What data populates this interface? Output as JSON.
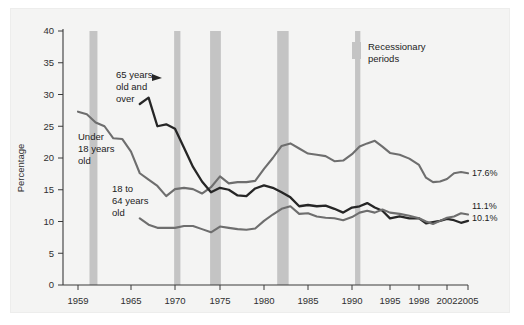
{
  "chart_data": {
    "type": "line",
    "title": "",
    "xlabel": "",
    "ylabel": "Percentage",
    "xlim": [
      1959,
      2005
    ],
    "ylim": [
      0,
      40
    ],
    "grid": false,
    "legend_position": "top-right",
    "y_ticks": [
      "0",
      "5",
      "10",
      "15",
      "20",
      "25",
      "30",
      "35",
      "40"
    ],
    "y_tick_values": [
      0,
      5,
      10,
      15,
      20,
      25,
      30,
      35,
      40
    ],
    "x_ticks": [
      "1959",
      "1965",
      "1970",
      "1975",
      "1980",
      "1985",
      "1990",
      "1995",
      "1998",
      "2002",
      "2005"
    ],
    "x_tick_values": [
      1959,
      1965,
      1970,
      1975,
      1980,
      1985,
      1990,
      1995,
      1998,
      2002,
      2005
    ],
    "series": [
      {
        "name": "Under 18 years old",
        "color": "#6e6e6e",
        "label_text": "Under\n18 years\nold",
        "end_value_label": "17.6%",
        "x": [
          1959,
          1960,
          1961,
          1962,
          1963,
          1964,
          1965,
          1966,
          1967,
          1968,
          1969,
          1970,
          1971,
          1972,
          1973,
          1974,
          1975,
          1976,
          1977,
          1978,
          1979,
          1980,
          1981,
          1982,
          1983,
          1984,
          1985,
          1986,
          1987,
          1988,
          1989,
          1990,
          1991,
          1992,
          1993,
          1994,
          1995,
          1996,
          1997,
          1998,
          1999,
          2000,
          2001,
          2002,
          2003,
          2004,
          2005
        ],
        "y": [
          27.3,
          26.9,
          25.6,
          25.0,
          23.1,
          23.0,
          21.0,
          17.6,
          16.6,
          15.6,
          14.0,
          15.1,
          15.3,
          15.1,
          14.4,
          15.4,
          17.1,
          16.0,
          16.2,
          16.2,
          16.4,
          18.3,
          20.0,
          21.9,
          22.3,
          21.5,
          20.7,
          20.5,
          20.3,
          19.5,
          19.6,
          20.6,
          21.8,
          22.3,
          22.7,
          21.8,
          20.8,
          20.5,
          19.9,
          18.9,
          16.9,
          16.2,
          16.3,
          16.7,
          17.6,
          17.8,
          17.6
        ]
      },
      {
        "name": "65 years old and over",
        "color": "#262626",
        "label_text": "65 years\nold and\nover",
        "end_value_label": "10.1%",
        "x": [
          1966,
          1967,
          1968,
          1969,
          1970,
          1971,
          1972,
          1973,
          1974,
          1975,
          1976,
          1977,
          1978,
          1979,
          1980,
          1981,
          1982,
          1983,
          1984,
          1985,
          1986,
          1987,
          1988,
          1989,
          1990,
          1991,
          1992,
          1993,
          1994,
          1995,
          1996,
          1997,
          1998,
          1999,
          2000,
          2001,
          2002,
          2003,
          2004,
          2005
        ],
        "y": [
          28.5,
          29.5,
          25.0,
          25.3,
          24.6,
          21.6,
          18.6,
          16.3,
          14.6,
          15.3,
          15.0,
          14.1,
          14.0,
          15.2,
          15.7,
          15.3,
          14.6,
          13.8,
          12.4,
          12.6,
          12.4,
          12.5,
          12.0,
          11.4,
          12.2,
          12.4,
          12.9,
          12.2,
          11.7,
          10.5,
          10.8,
          10.5,
          10.5,
          9.7,
          9.9,
          10.1,
          10.4,
          10.2,
          9.8,
          10.1
        ]
      },
      {
        "name": "18 to 64 years old",
        "color": "#6e6e6e",
        "label_text": "18 to\n64 years\nold",
        "end_value_label": "11.1%",
        "x": [
          1966,
          1967,
          1968,
          1969,
          1970,
          1971,
          1972,
          1973,
          1974,
          1975,
          1976,
          1977,
          1978,
          1979,
          1980,
          1981,
          1982,
          1983,
          1984,
          1985,
          1986,
          1987,
          1988,
          1989,
          1990,
          1991,
          1992,
          1993,
          1994,
          1995,
          1996,
          1997,
          1998,
          1999,
          2000,
          2001,
          2002,
          2003,
          2004,
          2005
        ],
        "y": [
          10.5,
          9.5,
          9.0,
          9.0,
          9.0,
          9.3,
          9.3,
          8.8,
          8.3,
          9.2,
          9.0,
          8.8,
          8.7,
          8.9,
          10.1,
          11.1,
          12.0,
          12.4,
          11.2,
          11.3,
          10.8,
          10.6,
          10.5,
          10.2,
          10.7,
          11.4,
          11.7,
          11.4,
          11.9,
          11.4,
          11.2,
          10.9,
          10.5,
          10.0,
          9.6,
          10.1,
          10.6,
          10.8,
          11.3,
          11.1
        ]
      }
    ],
    "recession_bands": [
      {
        "start": 1960.3,
        "end": 1961.2
      },
      {
        "start": 1969.9,
        "end": 1970.6
      },
      {
        "start": 1973.9,
        "end": 1975.1
      },
      {
        "start": 1981.5,
        "end": 1982.8
      },
      {
        "start": 1990.4,
        "end": 1991.1
      }
    ],
    "recession_band_color": "#c4c4c4",
    "legend": {
      "swatch_color": "#c4c4c4",
      "label_line1": "Recessionary",
      "label_line2": "periods"
    }
  }
}
